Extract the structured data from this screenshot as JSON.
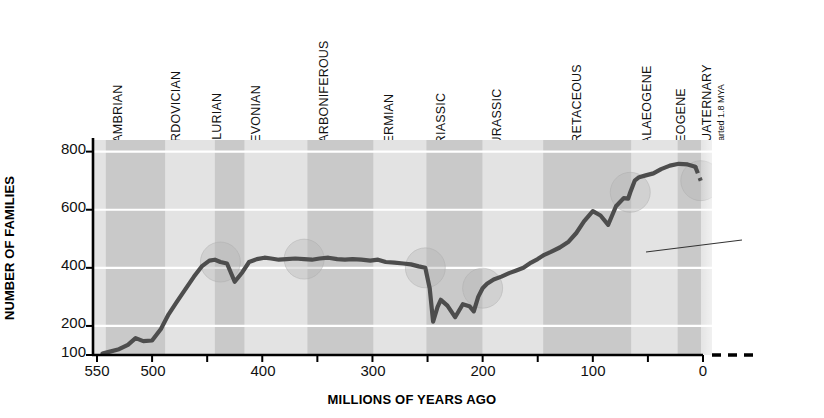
{
  "chart_data": {
    "type": "line",
    "title": "",
    "xlabel": "MILLIONS OF YEARS AGO",
    "ylabel": "NUMBER OF FAMILIES",
    "xlim": [
      560,
      0
    ],
    "ylim": [
      100,
      840
    ],
    "x_ticks": [
      550,
      500,
      450,
      400,
      350,
      300,
      250,
      200,
      150,
      100,
      50,
      0
    ],
    "x_tick_labels": [
      "550",
      "500",
      "",
      "400",
      "",
      "300",
      "",
      "200",
      "",
      "100",
      "",
      "0"
    ],
    "y_ticks": [
      100,
      200,
      400,
      600,
      800
    ],
    "y_tick_labels": [
      "100",
      "200",
      "400",
      "600",
      "800"
    ],
    "gridlines_y": [
      200,
      400,
      600,
      800
    ],
    "grid": true,
    "legend": "none",
    "series": [
      {
        "name": "Number of marine animal families",
        "x": [
          545,
          540,
          530,
          522,
          515,
          508,
          500,
          492,
          485,
          478,
          470,
          462,
          455,
          448,
          443,
          438,
          432,
          425,
          418,
          412,
          405,
          398,
          392,
          385,
          378,
          370,
          362,
          355,
          348,
          340,
          332,
          325,
          318,
          310,
          302,
          295,
          288,
          280,
          272,
          265,
          258,
          252,
          248,
          245,
          241,
          238,
          232,
          225,
          218,
          212,
          208,
          204,
          200,
          196,
          190,
          183,
          176,
          170,
          163,
          156,
          150,
          144,
          138,
          130,
          122,
          115,
          108,
          100,
          93,
          86,
          79,
          72,
          68,
          66,
          64,
          62,
          58,
          52,
          45,
          38,
          30,
          22,
          14,
          7,
          2
        ],
        "y": [
          105,
          110,
          120,
          135,
          158,
          148,
          150,
          190,
          240,
          280,
          325,
          370,
          405,
          425,
          428,
          420,
          415,
          352,
          385,
          420,
          430,
          435,
          432,
          428,
          430,
          432,
          430,
          428,
          432,
          435,
          430,
          428,
          430,
          428,
          425,
          428,
          420,
          418,
          415,
          412,
          405,
          400,
          330,
          215,
          265,
          290,
          270,
          230,
          275,
          268,
          250,
          300,
          330,
          345,
          360,
          370,
          382,
          390,
          400,
          418,
          430,
          445,
          455,
          470,
          490,
          520,
          560,
          595,
          580,
          548,
          612,
          640,
          638,
          660,
          680,
          700,
          712,
          718,
          725,
          740,
          752,
          758,
          756,
          748,
          700
        ],
        "color": "#4d4d4d"
      }
    ],
    "annotations": [
      {
        "text": "mass extinction event",
        "lines": [
          "mass",
          "extinction",
          "event"
        ]
      }
    ],
    "mass_extinction_markers_mya": [
      440,
      365,
      250,
      200,
      65,
      0
    ],
    "periods": [
      {
        "name": "CAMBRIAN",
        "start": 542,
        "end": 488,
        "shade": "dark"
      },
      {
        "name": "ORDOVICIAN",
        "start": 488,
        "end": 443,
        "shade": "light"
      },
      {
        "name": "SILURIAN",
        "start": 443,
        "end": 416,
        "shade": "dark"
      },
      {
        "name": "DEVONIAN",
        "start": 416,
        "end": 359,
        "shade": "light"
      },
      {
        "name": "CARBONIFEROUS",
        "start": 359,
        "end": 299,
        "shade": "dark"
      },
      {
        "name": "PERMIAN",
        "start": 299,
        "end": 251,
        "shade": "light"
      },
      {
        "name": "TRIASSIC",
        "start": 251,
        "end": 200,
        "shade": "dark"
      },
      {
        "name": "JURASSIC",
        "start": 200,
        "end": 145,
        "shade": "light"
      },
      {
        "name": "CRETACEOUS",
        "start": 145,
        "end": 65,
        "shade": "dark"
      },
      {
        "name": "PALAEOGENE",
        "start": 65,
        "end": 23,
        "shade": "light"
      },
      {
        "name": "NEOGENE",
        "start": 23,
        "end": 1.8,
        "shade": "dark"
      },
      {
        "name": "QUATERNARY",
        "start": 1.8,
        "end": 0,
        "shade": "light",
        "sublabel": "started 1.8 MYA"
      }
    ],
    "colors": {
      "band_dark": "#c9c9c9",
      "band_light": "#e3e3e3",
      "line": "#4d4d4d",
      "gridline": "#ffffff",
      "axis": "#000000",
      "marker_circle": "#b8b8b8",
      "text": "#111111"
    }
  },
  "ytick_labels": {
    "t800": "800",
    "t600": "600",
    "t400": "400",
    "t200": "200",
    "t100": "100"
  },
  "xtick_labels": {
    "t550": "550",
    "t500": "500",
    "t400": "400",
    "t300": "300",
    "t200": "200",
    "t100": "100",
    "t0": "0"
  },
  "axis_titles": {
    "y": "NUMBER OF FAMILIES",
    "x": "MILLIONS OF YEARS AGO"
  },
  "periods_text": {
    "cambrian": "CAMBRIAN",
    "ordovician": "ORDOVICIAN",
    "silurian": "SILURIAN",
    "devonian": "DEVONIAN",
    "carboniferous": "CARBONIFEROUS",
    "permian": "PERMIAN",
    "triassic": "TRIASSIC",
    "jurassic": "JURASSIC",
    "cretaceous": "CRETACEOUS",
    "palaeogene": "PALAEOGENE",
    "neogene": "NEOGENE",
    "quaternary": "QUATERNARY",
    "quaternary_sub": "started 1.8 MYA"
  },
  "annotation": {
    "line1": "mass",
    "line2": "extinction",
    "line3": "event"
  }
}
